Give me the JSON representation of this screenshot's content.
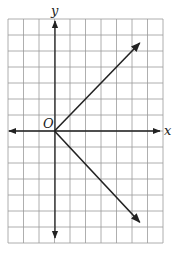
{
  "chart_data": {
    "type": "line",
    "title": "",
    "xlabel": "x",
    "ylabel": "y",
    "origin_label": "O",
    "xlim": [
      -3,
      7
    ],
    "ylim": [
      -7,
      7
    ],
    "grid": true,
    "grid_step": 1,
    "series": [
      {
        "name": "upper ray",
        "points": [
          [
            0,
            0
          ],
          [
            5.5,
            5.5
          ]
        ],
        "arrow_end": true
      },
      {
        "name": "lower ray",
        "points": [
          [
            0,
            0
          ],
          [
            5.5,
            -5.7
          ]
        ],
        "arrow_end": true
      }
    ],
    "colors": {
      "grid": "#9a9a9a",
      "axis": "#222222",
      "line": "#222222"
    }
  }
}
